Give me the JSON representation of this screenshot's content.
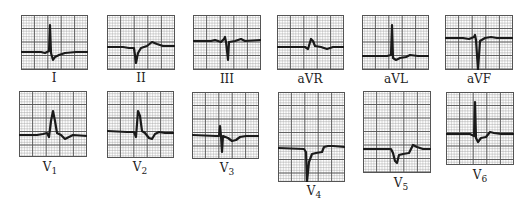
{
  "figure": {
    "colors": {
      "grid_major": "#555555",
      "grid_minor": "#9a9a9a",
      "trace": "#1a1a1a",
      "background": "#ffffff"
    },
    "leads": [
      {
        "id": "I",
        "label": "I",
        "sub": "",
        "box": [
          21,
          15,
          67,
          55
        ],
        "label_pos": [
          34,
          71
        ],
        "trace": "M0,37 L20,37 L24,38 L28,36 L29,10 L30,38 L32,45 L34,42 L38,40 L44,38 L55,37 L67,37"
      },
      {
        "id": "II",
        "label": "II",
        "sub": "",
        "box": [
          107,
          15,
          68,
          55
        ],
        "label_pos": [
          121,
          71
        ],
        "trace": "M0,32 L16,32 L22,33 L27,33 L29,48 L31,38 L34,33 L40,31 L45,27 L50,29 L56,31 L68,31"
      },
      {
        "id": "III",
        "label": "III",
        "sub": "",
        "box": [
          193,
          15,
          68,
          55
        ],
        "label_pos": [
          207,
          72
        ],
        "trace": "M0,26 L18,26 L22,25 L28,27 L31,24 L32,22 L33,27 L35,45 L36,27 L42,26 L48,24 L52,26 L68,25"
      },
      {
        "id": "aVR",
        "label": "aVR",
        "sub": "",
        "box": [
          277,
          15,
          67,
          55
        ],
        "label_pos": [
          290,
          72
        ],
        "trace": "M0,32 L28,32 L31,34 L34,24 L36,26 L38,31 L44,32 L50,34 L56,32 L67,32"
      },
      {
        "id": "aVL",
        "label": "aVL",
        "sub": "",
        "box": [
          362,
          15,
          67,
          55
        ],
        "label_pos": [
          376,
          72
        ],
        "trace": "M0,41 L25,41 L29,40 L30,10 L31,43 L34,45 L38,43 L44,42 L48,40 L56,41 L67,41"
      },
      {
        "id": "aVF",
        "label": "aVF",
        "sub": "",
        "box": [
          445,
          15,
          68,
          55
        ],
        "label_pos": [
          459,
          72
        ],
        "trace": "M0,23 L18,23 L24,24 L29,22 L30,20 L31,25 L33,55 L35,26 L40,23 L46,22 L52,23 L68,23"
      },
      {
        "id": "V1",
        "label": "V",
        "sub": "1",
        "box": [
          19,
          91,
          68,
          66
        ],
        "label_pos": [
          30,
          160
        ],
        "trace": "M0,44 L18,44 L24,43 L28,42 L30,46 L32,30 L34,20 L36,30 L38,42 L42,44 L46,48 L50,46 L54,44 L68,45"
      },
      {
        "id": "V2",
        "label": "V",
        "sub": "2",
        "box": [
          107,
          91,
          67,
          67
        ],
        "label_pos": [
          120,
          160
        ],
        "trace": "M0,40 L20,41 L27,41 L29,46 L31,20 L33,25 L35,40 L38,42 L42,47 L45,48 L48,43 L52,41 L58,42 L67,42"
      },
      {
        "id": "V3",
        "label": "V",
        "sub": "3",
        "box": [
          192,
          92,
          67,
          67
        ],
        "label_pos": [
          207,
          161
        ],
        "trace": "M0,43 L24,44 L27,44 L28,34 L29,44 L30,60 L31,44 L36,46 L40,49 L44,48 L48,45 L54,44 L67,44"
      },
      {
        "id": "V4",
        "label": "V",
        "sub": "4",
        "box": [
          278,
          92,
          67,
          90
        ],
        "label_pos": [
          294,
          184
        ],
        "trace": "M0,56 L26,57 L28,60 L29,90 L31,70 L34,62 L38,61 L44,60 L46,55 L50,54 L55,54 L67,55"
      },
      {
        "id": "V5",
        "label": "V",
        "sub": "5",
        "box": [
          363,
          91,
          68,
          82
        ],
        "label_pos": [
          381,
          176
        ],
        "trace": "M0,58 L28,58 L30,62 L32,70 L34,72 L36,64 L40,63 L46,62 L50,54 L54,56 L60,58 L68,58"
      },
      {
        "id": "V6",
        "label": "V",
        "sub": "6",
        "box": [
          446,
          92,
          68,
          73
        ],
        "label_pos": [
          460,
          168
        ],
        "trace": "M0,42 L24,42 L28,44 L29,10 L30,46 L32,50 L35,46 L40,45 L44,40 L48,41 L55,42 L68,42"
      }
    ]
  }
}
